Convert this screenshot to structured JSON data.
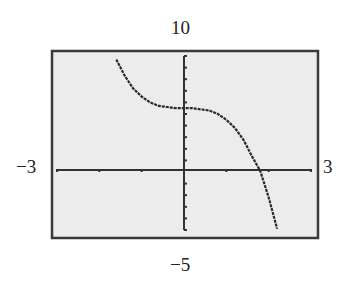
{
  "labels": {
    "ymax": "10",
    "ymin": "−5",
    "xmin": "−3",
    "xmax": "3"
  },
  "colors": {
    "screen_bg": "#ececec",
    "frame": "#3a3a3a",
    "curve": "#2a2a2a",
    "axes": "#333333"
  },
  "chart_data": {
    "type": "line",
    "title": "",
    "xlabel": "",
    "ylabel": "",
    "xlim": [
      -3,
      3
    ],
    "ylim": [
      -5,
      10
    ],
    "xscale": 1,
    "yscale": 1,
    "grid": false,
    "legend": null,
    "window_labels": {
      "xmin": "−3",
      "xmax": "3",
      "ymin": "−5",
      "ymax": "10"
    },
    "series": [
      {
        "name": "f(x)",
        "x": [
          -1.6,
          -1.4,
          -1.2,
          -1.0,
          -0.8,
          -0.6,
          -0.4,
          -0.2,
          0.0,
          0.2,
          0.4,
          0.6,
          0.8,
          1.0,
          1.2,
          1.4,
          1.6,
          1.8,
          2.0,
          2.2
        ],
        "y": [
          9.7,
          8.3,
          7.2,
          6.5,
          6.0,
          5.7,
          5.6,
          5.5,
          5.5,
          5.5,
          5.4,
          5.3,
          5.0,
          4.5,
          3.8,
          2.8,
          1.4,
          0.1,
          -2.2,
          -4.9
        ]
      }
    ],
    "x_intercept": 1.8
  }
}
